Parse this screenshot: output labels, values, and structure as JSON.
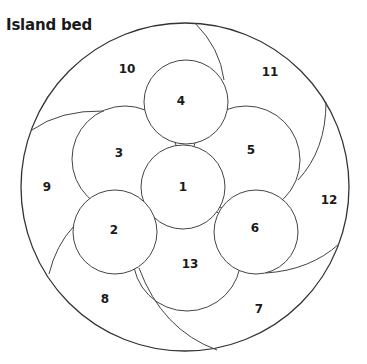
{
  "title": "Island bed",
  "colors": {
    "line": "#444444",
    "outer_line": "#333333",
    "text": "#1a1a1a",
    "background": "#ffffff"
  },
  "diagram": {
    "outer": {
      "cx": 185,
      "cy": 187,
      "r": 164
    },
    "circles": [
      {
        "id": "3",
        "cx": 125,
        "cy": 159,
        "r": 53
      },
      {
        "id": "5",
        "cx": 246,
        "cy": 160,
        "r": 54
      },
      {
        "id": "13",
        "cx": 187,
        "cy": 257,
        "r": 54
      },
      {
        "id": "1",
        "cx": 183,
        "cy": 187,
        "r": 42
      },
      {
        "id": "4",
        "cx": 186,
        "cy": 102,
        "r": 42
      },
      {
        "id": "2",
        "cx": 115,
        "cy": 232,
        "r": 42
      },
      {
        "id": "6",
        "cx": 256,
        "cy": 232,
        "r": 42
      }
    ],
    "labels": [
      {
        "text": "1",
        "x": 183,
        "y": 187
      },
      {
        "text": "2",
        "x": 114,
        "y": 230
      },
      {
        "text": "3",
        "x": 119,
        "y": 153
      },
      {
        "text": "4",
        "x": 181,
        "y": 101
      },
      {
        "text": "5",
        "x": 251,
        "y": 150
      },
      {
        "text": "6",
        "x": 255,
        "y": 228
      },
      {
        "text": "7",
        "x": 259,
        "y": 309
      },
      {
        "text": "8",
        "x": 105,
        "y": 299
      },
      {
        "text": "9",
        "x": 47,
        "y": 187
      },
      {
        "text": "10",
        "x": 127,
        "y": 69
      },
      {
        "text": "11",
        "x": 270,
        "y": 72
      },
      {
        "text": "12",
        "x": 329,
        "y": 200
      },
      {
        "text": "13",
        "x": 190,
        "y": 264
      }
    ]
  }
}
